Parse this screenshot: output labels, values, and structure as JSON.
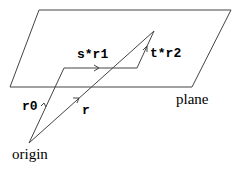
{
  "diagram": {
    "labels": {
      "plane": "plane",
      "origin": "origin",
      "r0": "r0",
      "r": "r",
      "s_r1": "s*r1",
      "t_r2": "t*r2"
    },
    "colors": {
      "stroke": "#444444",
      "text": "#000000",
      "background": "#ffffff"
    }
  }
}
